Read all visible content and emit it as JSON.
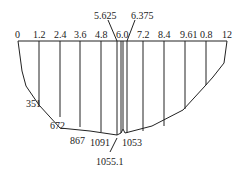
{
  "diagram": {
    "type": "cross-section",
    "top_labels": [
      "0",
      "1.2",
      "2.4",
      "3.6",
      "4.8",
      "6.0",
      "7.2",
      "8.4",
      "9.61",
      "0.8",
      "12"
    ],
    "callouts_top": [
      "5.625",
      "6.375"
    ],
    "bottom_labels": [
      "351",
      "672",
      "867",
      "1091",
      "1053"
    ],
    "callout_bottom": "1055.1",
    "stroke_color": "#222222"
  }
}
